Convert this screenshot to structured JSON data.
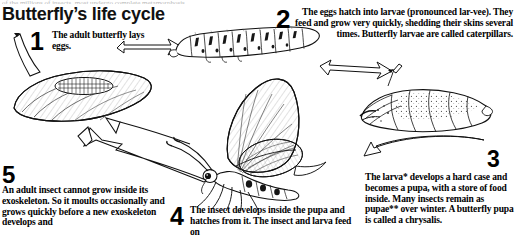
{
  "page": {
    "title": "Butterfly’s life cycle",
    "top_clipped_line": "of the millions of insects, most undergo complete metamorphosis",
    "background_color": "#ffffff",
    "ink_color": "#000000"
  },
  "steps": [
    {
      "number": "1",
      "text": "The adult butterfly lays eggs.",
      "align": "left",
      "illustration": "leaf-with-eggs"
    },
    {
      "number": "2",
      "text": "The eggs hatch into larvae (pronounced lar-vee). They feed and grow very quickly, shedding their skins several times. Butterfly larvae are called caterpillars.",
      "align": "right",
      "illustration": "caterpillar"
    },
    {
      "number": "3",
      "text": "The larva* develops a hard case and becomes a pupa, with a store of food inside. Many insects remain as pupae** over winter. A butterfly pupa is called a chrysalis.",
      "align": "left",
      "illustration": "pupa-chrysalis"
    },
    {
      "number": "4",
      "text": "The insect develops inside the pupa and hatches from it. The insect and larva feed on",
      "align": "left",
      "illustration": "adult-butterfly"
    },
    {
      "number": "5",
      "text": "An adult insect cannot grow inside its exoskeleton. So it moults occasionally and grows quickly before a new exoskeleton develops and",
      "align": "left",
      "illustration": "adult-butterfly"
    }
  ],
  "illustrations": [
    {
      "name": "leaf-with-eggs",
      "label": "Leaf with a cluster of butterfly eggs"
    },
    {
      "name": "caterpillar",
      "label": "Butterfly caterpillar (larva)"
    },
    {
      "name": "pupa-chrysalis",
      "label": "Butterfly pupa / chrysalis"
    },
    {
      "name": "adult-butterfly",
      "label": "Adult butterfly, side view with wings raised"
    }
  ],
  "arrows": [
    {
      "name": "arrow-eggs-to-larva",
      "direction": "right"
    },
    {
      "name": "arrow-larva-to-pupa",
      "direction": "right"
    },
    {
      "name": "arrow-pupa-to-adult",
      "direction": "left"
    },
    {
      "name": "arrow-adult-to-eggs",
      "direction": "left"
    }
  ]
}
